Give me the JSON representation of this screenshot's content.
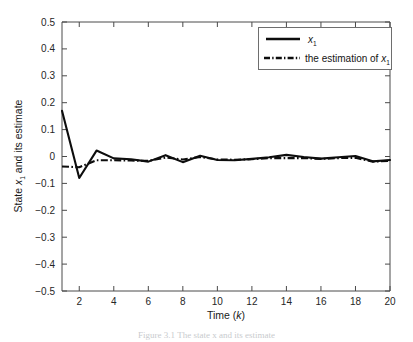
{
  "figure": {
    "background_color": "#ffffff",
    "line_color": "#0d0d0d",
    "axis_color": "#4a4a4a",
    "caption": "Figure 3.1   The state x and its estimate"
  },
  "axes": {
    "x_label_prefix": "Time (",
    "x_label_var": "k",
    "x_label_suffix": ")",
    "y_label_prefix": "State ",
    "y_label_var": "x",
    "y_label_sub": "1",
    "y_label_suffix": " and its estimate",
    "x_ticks": [
      "2",
      "4",
      "6",
      "8",
      "10",
      "12",
      "14",
      "16",
      "18",
      "20"
    ],
    "y_ticks": [
      "0.5",
      "0.4",
      "0.3",
      "0.2",
      "0.1",
      "0",
      "-0.1",
      "-0.2",
      "-0.3",
      "-0.4",
      "-0.5"
    ]
  },
  "legend": {
    "position": "top-right",
    "entries": [
      {
        "style": "solid",
        "label_var": "x",
        "label_sub": "1",
        "label_prefix": ""
      },
      {
        "style": "dash-dot",
        "label_var": "x",
        "label_sub": "1",
        "label_prefix": "the estimation of "
      }
    ]
  },
  "chart_data": {
    "type": "line",
    "title": "",
    "xlabel": "Time (k)",
    "ylabel": "State x_1 and its estimate",
    "xlim": [
      1,
      20
    ],
    "ylim": [
      -0.5,
      0.5
    ],
    "xticks": [
      2,
      4,
      6,
      8,
      10,
      12,
      14,
      16,
      18,
      20
    ],
    "yticks": [
      -0.5,
      -0.4,
      -0.3,
      -0.2,
      -0.1,
      0,
      0.1,
      0.2,
      0.3,
      0.4,
      0.5
    ],
    "grid": false,
    "legend_position": "upper right",
    "x": [
      1,
      2,
      3,
      4,
      5,
      6,
      7,
      8,
      9,
      10,
      11,
      12,
      13,
      14,
      15,
      16,
      17,
      18,
      19,
      20
    ],
    "series": [
      {
        "name": "x_1",
        "style": "solid",
        "values": [
          0.17,
          -0.08,
          0.022,
          -0.007,
          -0.01,
          -0.019,
          0.005,
          -0.021,
          0.003,
          -0.013,
          -0.014,
          -0.009,
          -0.003,
          0.006,
          -0.002,
          -0.008,
          -0.003,
          0.002,
          -0.018,
          -0.013
        ]
      },
      {
        "name": "the estimation of x_1",
        "style": "dash-dot",
        "values": [
          -0.037,
          -0.04,
          -0.014,
          -0.014,
          -0.015,
          -0.016,
          -0.004,
          -0.011,
          -0.002,
          -0.011,
          -0.012,
          -0.01,
          -0.006,
          -0.006,
          -0.006,
          -0.009,
          -0.006,
          -0.005,
          -0.019,
          -0.016
        ]
      }
    ]
  }
}
